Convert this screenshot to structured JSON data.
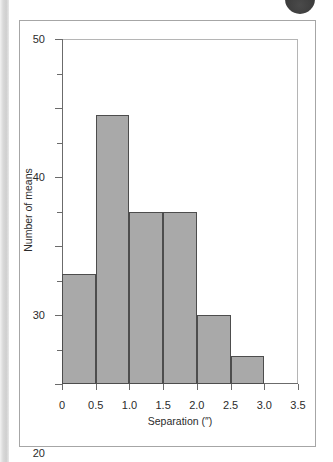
{
  "figure": {
    "background_color": "#ffffff",
    "border_color": "#a6a6a6",
    "gutter_color": "#d9d9d9",
    "corner_badge": {
      "name": "page-corner-badge",
      "color": "#3c3c3c"
    }
  },
  "chart_data": {
    "type": "bar",
    "title": "",
    "subtitle": "",
    "xlabel": "Separation (″)",
    "ylabel": "Number of means",
    "categories": [
      "0–0.5",
      "0.5–1.0",
      "1.0–1.5",
      "1.5–2.0",
      "2.0–2.5",
      "2.5–3.0"
    ],
    "bin_edges": [
      0,
      0.5,
      1.0,
      1.5,
      2.0,
      2.5,
      3.0
    ],
    "bin_width": 0.5,
    "values": [
      16,
      39,
      25,
      25,
      10,
      4
    ],
    "bars": [
      {
        "x_start": 0,
        "x_end": 0.5,
        "value": 16
      },
      {
        "x_start": 0.5,
        "x_end": 1.0,
        "value": 39
      },
      {
        "x_start": 1.0,
        "x_end": 1.5,
        "value": 25
      },
      {
        "x_start": 1.5,
        "x_end": 2.0,
        "value": 25
      },
      {
        "x_start": 2.0,
        "x_end": 2.5,
        "value": 10
      },
      {
        "x_start": 2.5,
        "x_end": 3.0,
        "value": 4
      }
    ],
    "xlim": [
      0,
      3.5
    ],
    "ylim": [
      0,
      50
    ],
    "x_ticks": [
      0,
      0.5,
      1.0,
      1.5,
      2.0,
      2.5,
      3.0,
      3.5
    ],
    "x_tick_labels": [
      "0",
      "0.5",
      "1.0",
      "1.5",
      "2.0",
      "2.5",
      "3.0",
      "3.5"
    ],
    "y_ticks_major": [
      0,
      10,
      20,
      30,
      40,
      50
    ],
    "y_tick_labels": [
      "0",
      "10",
      "20",
      "30",
      "40",
      "50"
    ],
    "y_ticks_minor": [
      5,
      15,
      25,
      35,
      45
    ],
    "grid": false,
    "legend": null,
    "bar_fill_color": "#a9a9a9",
    "bar_edge_color": "#4d4d4d",
    "axis_color": "#6b6b6b",
    "frame_color": "#b5b5b5"
  }
}
